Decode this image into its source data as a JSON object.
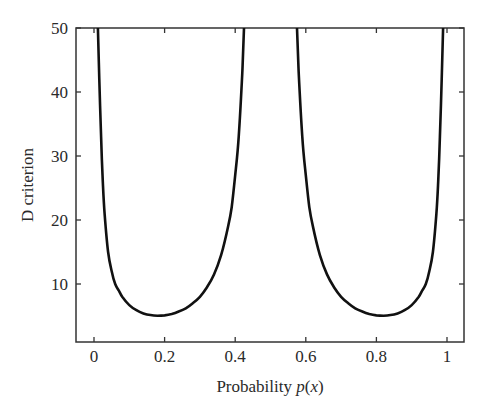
{
  "chart_data": {
    "type": "line",
    "title": "",
    "xlabel": "Probability p(x)",
    "xlabel_parts": {
      "prefix": "Probability ",
      "italic": "p",
      "suffix": "(x)"
    },
    "ylabel": "D criterion",
    "xlim": [
      -0.05,
      1.05
    ],
    "ylim": [
      1,
      50
    ],
    "xticks": [
      0,
      0.2,
      0.4,
      0.6,
      0.8,
      1
    ],
    "xtick_labels": [
      "0",
      "0.2",
      "0.4",
      "0.6",
      "0.8",
      "1"
    ],
    "yticks": [
      10,
      20,
      30,
      40,
      50
    ],
    "ytick_labels": [
      "10",
      "20",
      "30",
      "40",
      "50"
    ],
    "grid": false,
    "legend": null,
    "series": [
      {
        "name": "D criterion (left branch)",
        "color": "#111111",
        "x": [
          0.011,
          0.015,
          0.02,
          0.025,
          0.03,
          0.04,
          0.05,
          0.06,
          0.07,
          0.08,
          0.1,
          0.12,
          0.14,
          0.16,
          0.18,
          0.2,
          0.22,
          0.24,
          0.26,
          0.28,
          0.3,
          0.32,
          0.34,
          0.36,
          0.38,
          0.39,
          0.4,
          0.41,
          0.42,
          0.425
        ],
        "y": [
          50,
          42,
          33,
          26,
          21,
          15,
          12,
          10,
          9,
          8,
          6.7,
          5.9,
          5.4,
          5.15,
          5.05,
          5.1,
          5.3,
          5.7,
          6.2,
          7.0,
          8.0,
          9.5,
          11.5,
          14.5,
          19,
          22,
          27,
          33,
          43,
          50
        ]
      },
      {
        "name": "D criterion (right branch)",
        "color": "#111111",
        "x": [
          0.575,
          0.58,
          0.59,
          0.6,
          0.61,
          0.62,
          0.64,
          0.66,
          0.68,
          0.7,
          0.72,
          0.74,
          0.76,
          0.78,
          0.8,
          0.82,
          0.84,
          0.86,
          0.88,
          0.9,
          0.92,
          0.93,
          0.94,
          0.95,
          0.96,
          0.97,
          0.975,
          0.98,
          0.985,
          0.989
        ],
        "y": [
          50,
          43,
          33,
          27,
          22,
          19,
          14.5,
          11.5,
          9.5,
          8.0,
          7.0,
          6.2,
          5.7,
          5.3,
          5.1,
          5.05,
          5.15,
          5.4,
          5.9,
          6.7,
          8,
          9,
          10,
          12,
          15,
          21,
          26,
          33,
          42,
          50
        ]
      }
    ]
  }
}
